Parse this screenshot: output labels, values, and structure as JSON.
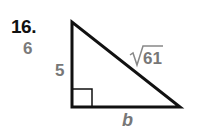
{
  "problem": {
    "number": "16.",
    "answer": "6"
  },
  "triangle": {
    "leg_vertical_label": "5",
    "hypotenuse_label": "61",
    "hypotenuse_radical": "√",
    "leg_horizontal_label": "b",
    "right_angle": true
  },
  "colors": {
    "number": "#111111",
    "labels": "#777777",
    "lines": "#111111"
  }
}
